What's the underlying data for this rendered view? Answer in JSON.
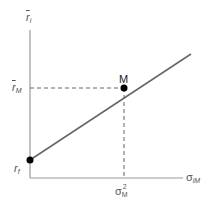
{
  "diagram": {
    "type": "capital-market-line",
    "y_axis_label": {
      "main": "r",
      "sub": "i"
    },
    "x_axis_label": {
      "main": "σ",
      "sub": "iM"
    },
    "y_tick_market_return": {
      "main": "r",
      "sub": "M"
    },
    "y_tick_risk_free": {
      "main": "r",
      "sub": "f"
    },
    "x_tick_market_variance": {
      "main": "σ",
      "sub": "M",
      "sup": "2"
    },
    "point_label": "M",
    "colors": {
      "axis": "#888888",
      "line": "#666666",
      "point": "#000000",
      "dash": "#666666",
      "text": "#555555"
    }
  }
}
